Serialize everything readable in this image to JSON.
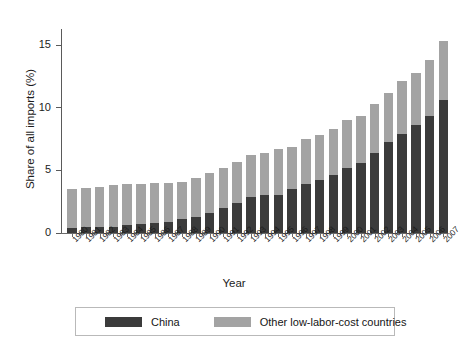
{
  "chart_data": {
    "type": "bar",
    "subtype": "stacked-bar",
    "title": "",
    "xlabel": "Year",
    "ylabel": "Share of all imports (%)",
    "ylim": [
      0,
      16.2
    ],
    "yticks": [
      0,
      5,
      10,
      15
    ],
    "ytick_labels": [
      "0",
      "5",
      "10",
      "15"
    ],
    "grid": false,
    "legend_position": "bottom",
    "categories": [
      "1980",
      "1981",
      "1982",
      "1983",
      "1984",
      "1985",
      "1986",
      "1987",
      "1988",
      "1989",
      "1990",
      "1991",
      "1992",
      "1993",
      "1994",
      "1995",
      "1996",
      "1997",
      "1998",
      "1999",
      "2000",
      "2001",
      "2002",
      "2003",
      "2004",
      "2005",
      "2006",
      "2007"
    ],
    "series": [
      {
        "name": "China",
        "color": "#3b3b3b",
        "values": [
          0.4,
          0.5,
          0.5,
          0.5,
          0.6,
          0.7,
          0.8,
          0.9,
          1.1,
          1.3,
          1.6,
          2.0,
          2.4,
          2.9,
          3.0,
          3.0,
          3.5,
          3.9,
          4.2,
          4.6,
          5.2,
          5.6,
          6.4,
          7.3,
          7.9,
          8.6,
          9.3,
          10.6
        ]
      },
      {
        "name": "Other low-labor-cost countries",
        "color": "#a3a3a3",
        "values": [
          3.1,
          3.1,
          3.2,
          3.3,
          3.3,
          3.2,
          3.2,
          3.1,
          3.0,
          3.1,
          3.2,
          3.2,
          3.3,
          3.3,
          3.4,
          3.7,
          3.4,
          3.6,
          3.6,
          3.7,
          3.8,
          3.7,
          3.9,
          3.9,
          4.2,
          4.2,
          4.5,
          4.7
        ]
      }
    ],
    "totals": [
      3.5,
      3.6,
      3.7,
      3.8,
      3.9,
      3.9,
      4.0,
      4.0,
      4.1,
      4.4,
      4.8,
      5.2,
      5.7,
      6.2,
      6.4,
      6.7,
      6.9,
      7.5,
      7.8,
      8.3,
      9.0,
      9.3,
      10.3,
      11.2,
      12.1,
      12.8,
      13.8,
      15.3
    ]
  },
  "legend": {
    "items": [
      {
        "label": "China",
        "color": "#3b3b3b"
      },
      {
        "label": "Other low-labor-cost countries",
        "color": "#a3a3a3"
      }
    ]
  },
  "axes": {
    "y_title": "Share of all imports (%)",
    "x_title": "Year"
  }
}
